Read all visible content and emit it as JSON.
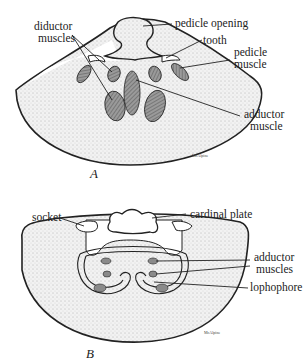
{
  "figure_a": {
    "label": "A",
    "signature": "McAlpine",
    "callouts": {
      "diductor_line1": "diductor",
      "diductor_line2": "muscles",
      "pedicle_opening": "pedicle opening",
      "tooth": "tooth",
      "pedicle_muscle_line1": "pedicle",
      "pedicle_muscle_line2": "muscle",
      "adductor_line1": "adductor",
      "adductor_line2": "muscle"
    }
  },
  "figure_b": {
    "label": "B",
    "signature": "McAlpine",
    "callouts": {
      "socket": "socket",
      "cardinal_plate": "cardinal plate",
      "adductor_line1": "adductor",
      "adductor_line2": "muscles",
      "lophophore": "lophophore"
    }
  },
  "colors": {
    "ink": "#222222",
    "shell_fill": "#e6e6e6",
    "muscle_fill": "#8a8a8a"
  }
}
